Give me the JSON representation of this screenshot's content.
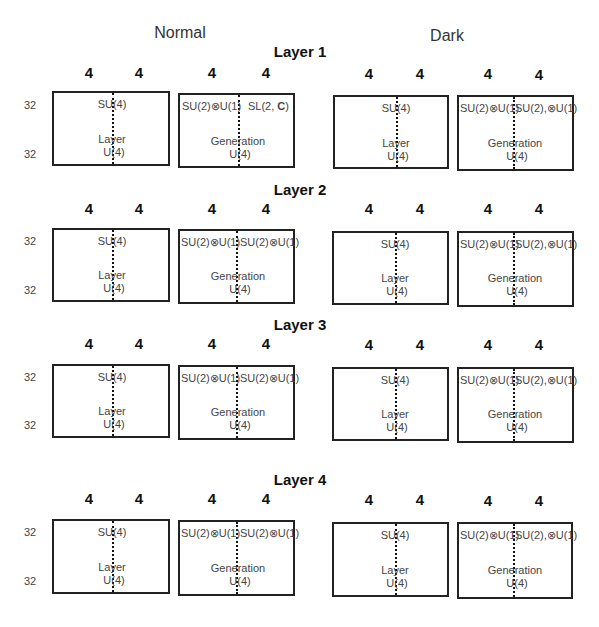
{
  "columns": {
    "normal": "Normal",
    "dark": "Dark"
  },
  "row_labels": {
    "top": "32",
    "bottom": "32"
  },
  "layers": [
    {
      "title": "Layer 1",
      "dims": [
        "4",
        "4",
        "4",
        "4",
        "4",
        "4",
        "4",
        "4"
      ],
      "normal": {
        "layer_box": {
          "top": "SU(4)",
          "name": "Layer",
          "bottom": "U(4)"
        },
        "gen_box": {
          "top_left": "SU(2)⊗U(1)",
          "top_right_prefix": "SL(2, ",
          "top_right_bold": "C",
          "top_right_suffix": ")",
          "name": "Generation",
          "bottom": "U(4)"
        }
      },
      "dark": {
        "layer_box": {
          "top": "SU(4)",
          "name": "Layer",
          "bottom": "U(4)"
        },
        "gen_box": {
          "top_left": "SU(2)⊗U(1)",
          "top_right": "SU(2),⊗U(1)",
          "name": "Generation",
          "bottom": "U(4)"
        }
      }
    },
    {
      "title": "Layer 2",
      "dims": [
        "4",
        "4",
        "4",
        "4",
        "4",
        "4",
        "4",
        "4"
      ],
      "normal": {
        "layer_box": {
          "top": "SU(4)",
          "name": "Layer",
          "bottom": "U(4)"
        },
        "gen_box": {
          "top_left": "SU(2)⊗U(1)",
          "top_right": "SU(2)⊗U(1)",
          "name": "Generation",
          "bottom": "U(4)"
        }
      },
      "dark": {
        "layer_box": {
          "top": "SU(4)",
          "name": "Layer",
          "bottom": "U(4)"
        },
        "gen_box": {
          "top_left": "SU(2)⊗U(1)",
          "top_right": "SU(2),⊗U(1)",
          "name": "Generation",
          "bottom": "U(4)"
        }
      }
    },
    {
      "title": "Layer 3",
      "dims": [
        "4",
        "4",
        "4",
        "4",
        "4",
        "4",
        "4",
        "4"
      ],
      "normal": {
        "layer_box": {
          "top": "SU(4)",
          "name": "Layer",
          "bottom": "U(4)"
        },
        "gen_box": {
          "top_left": "SU(2)⊗U(1)",
          "top_right": "SU(2)⊗U(1)",
          "name": "Generation",
          "bottom": "U(4)"
        }
      },
      "dark": {
        "layer_box": {
          "top": "SU(4)",
          "name": "Layer",
          "bottom": "U(4)"
        },
        "gen_box": {
          "top_left": "SU(2)⊗U(1)",
          "top_right": "SU(2),⊗U(1)",
          "name": "Generation",
          "bottom": "U(4)"
        }
      }
    },
    {
      "title": "Layer 4",
      "dims": [
        "4",
        "4",
        "4",
        "4",
        "4",
        "4",
        "4",
        "4"
      ],
      "normal": {
        "layer_box": {
          "top": "SU(4)",
          "name": "Layer",
          "bottom": "U(4)"
        },
        "gen_box": {
          "top_left": "SU(2)⊗U(1)",
          "top_right": "SU(2)⊗U(1)",
          "name": "Generation",
          "bottom": "U(4)"
        }
      },
      "dark": {
        "layer_box": {
          "top": "SU(4)",
          "name": "Layer",
          "bottom": "U(4)"
        },
        "gen_box": {
          "top_left": "SU(2)⊗U(1)",
          "top_right": "SU(2),⊗U(1)",
          "name": "Generation",
          "bottom": "U(4)"
        }
      }
    }
  ]
}
